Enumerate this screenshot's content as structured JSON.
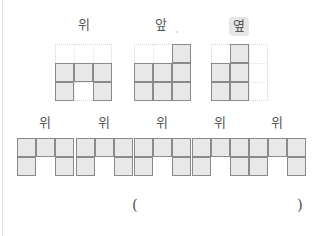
{
  "views": {
    "top": {
      "label": "위"
    },
    "front": {
      "label": "앞",
      "mark": "."
    },
    "side": {
      "label": "옆",
      "highlighted": true
    }
  },
  "top_views": {
    "top": {
      "rows": 3,
      "cols": 3,
      "filled": [
        [
          1,
          0
        ],
        [
          1,
          1
        ],
        [
          1,
          2
        ],
        [
          2,
          0
        ],
        [
          2,
          2
        ]
      ]
    },
    "front": {
      "rows": 3,
      "cols": 3,
      "filled": [
        [
          0,
          2
        ],
        [
          1,
          0
        ],
        [
          1,
          1
        ],
        [
          1,
          2
        ],
        [
          2,
          0
        ],
        [
          2,
          1
        ],
        [
          2,
          2
        ]
      ]
    },
    "side": {
      "rows": 3,
      "cols": 3,
      "filled": [
        [
          0,
          1
        ],
        [
          1,
          0
        ],
        [
          1,
          1
        ],
        [
          2,
          0
        ],
        [
          2,
          1
        ]
      ]
    }
  },
  "options": [
    {
      "label": "위",
      "filled": [
        [
          0,
          0
        ],
        [
          0,
          1
        ],
        [
          0,
          2
        ],
        [
          1,
          0
        ],
        [
          1,
          2
        ]
      ]
    },
    {
      "label": "위",
      "filled": [
        [
          0,
          0
        ],
        [
          0,
          1
        ],
        [
          0,
          2
        ],
        [
          1,
          0
        ],
        [
          1,
          2
        ]
      ]
    },
    {
      "label": "위",
      "filled": [
        [
          0,
          0
        ],
        [
          0,
          1
        ],
        [
          0,
          2
        ],
        [
          1,
          0
        ],
        [
          1,
          2
        ]
      ]
    },
    {
      "label": "위",
      "filled": [
        [
          0,
          0
        ],
        [
          0,
          1
        ],
        [
          0,
          2
        ],
        [
          1,
          0
        ],
        [
          1,
          2
        ]
      ]
    },
    {
      "label": "위",
      "filled": [
        [
          0,
          0
        ],
        [
          0,
          1
        ],
        [
          0,
          2
        ],
        [
          1,
          0
        ],
        [
          1,
          2
        ]
      ]
    }
  ],
  "answer": {
    "open_paren": "(",
    "close_paren": ")",
    "value": ""
  }
}
